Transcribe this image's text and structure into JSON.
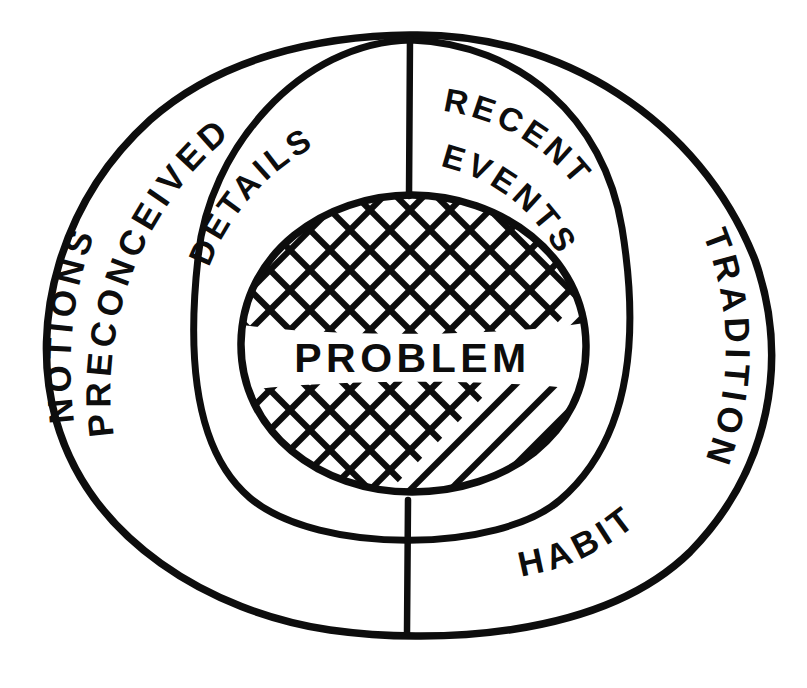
{
  "diagram": {
    "style": "hand-drawn ink sketch",
    "ink_color": "#0d0d0d",
    "background_color": "#ffffff",
    "core": {
      "label": "PROBLEM",
      "fill_pattern": "cross-hatch"
    },
    "rings": [
      {
        "name": "inner-ring",
        "segments": [
          {
            "id": "details",
            "label": "DETAILS",
            "position": "upper-left"
          },
          {
            "id": "recent-events",
            "label_line_1": "RECENT",
            "label_line_2": "EVENTS",
            "position": "upper-right"
          }
        ]
      },
      {
        "name": "outer-ring",
        "segments": [
          {
            "id": "preconceived-notions",
            "label_line_1": "PRECONCEIVED",
            "label_line_2": "NOTIONS",
            "position": "left"
          },
          {
            "id": "tradition",
            "label": "TRADITION",
            "position": "right"
          },
          {
            "id": "habit",
            "label": "HABIT",
            "position": "lower-right"
          }
        ]
      }
    ]
  }
}
